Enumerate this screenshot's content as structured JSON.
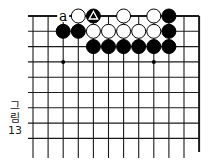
{
  "figure": {
    "caption_lines": [
      "그",
      "림",
      "13"
    ],
    "caption": "그림 13"
  },
  "board": {
    "columns": 12,
    "rows": 10,
    "origin_x": 33,
    "origin_y": 16,
    "spacing_x": 15.1,
    "spacing_y": 15.3,
    "top_edge": true,
    "right_edge": true,
    "line_color": "#1a1a1a",
    "stone_black": "#000000",
    "stone_white": "#ffffff",
    "star_points": [
      [
        2,
        3
      ],
      [
        8,
        3
      ]
    ],
    "stones": [
      {
        "col": 3,
        "row": 0,
        "color": "white"
      },
      {
        "col": 4,
        "row": 0,
        "color": "black",
        "mark": "triangle"
      },
      {
        "col": 6,
        "row": 0,
        "color": "white"
      },
      {
        "col": 8,
        "row": 0,
        "color": "white"
      },
      {
        "col": 9,
        "row": 0,
        "color": "black"
      },
      {
        "col": 2,
        "row": 1,
        "color": "black"
      },
      {
        "col": 3,
        "row": 1,
        "color": "black"
      },
      {
        "col": 4,
        "row": 1,
        "color": "white"
      },
      {
        "col": 5,
        "row": 1,
        "color": "white"
      },
      {
        "col": 6,
        "row": 1,
        "color": "white"
      },
      {
        "col": 7,
        "row": 1,
        "color": "white"
      },
      {
        "col": 8,
        "row": 1,
        "color": "white"
      },
      {
        "col": 9,
        "row": 1,
        "color": "black"
      },
      {
        "col": 4,
        "row": 2,
        "color": "black"
      },
      {
        "col": 5,
        "row": 2,
        "color": "black"
      },
      {
        "col": 6,
        "row": 2,
        "color": "black"
      },
      {
        "col": 7,
        "row": 2,
        "color": "black"
      },
      {
        "col": 8,
        "row": 2,
        "color": "black"
      },
      {
        "col": 9,
        "row": 2,
        "color": "black"
      }
    ],
    "labels": [
      {
        "col": 2,
        "row": 0,
        "text": "a"
      }
    ]
  }
}
